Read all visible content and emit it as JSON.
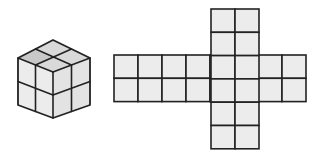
{
  "figure": {
    "cube": {
      "name": "2x2x2 cube",
      "vertices": {
        "top": [
          53,
          40
        ],
        "left_top": [
          18,
          58
        ],
        "right_top": [
          90,
          58
        ],
        "center": [
          53,
          72
        ],
        "left_bottom": [
          18,
          105
        ],
        "right_bottom": [
          90,
          105
        ],
        "bottom": [
          53,
          118
        ]
      },
      "colors": {
        "top": "#d9d9d9",
        "left": "#ececec",
        "right": "#e3e3e3",
        "top_shaded": "#c8c8c8",
        "stroke": "#222222"
      }
    },
    "net": {
      "name": "cube net",
      "cell_w": 24,
      "cell_h": 23.3,
      "horizontal_strip": {
        "x": 114,
        "y": 55,
        "cols": 8,
        "rows": 2
      },
      "vertical_strip": {
        "x": 211,
        "y": 9,
        "cols": 2,
        "rows": 6
      },
      "fill": "#ececec",
      "stroke": "#222222"
    }
  }
}
